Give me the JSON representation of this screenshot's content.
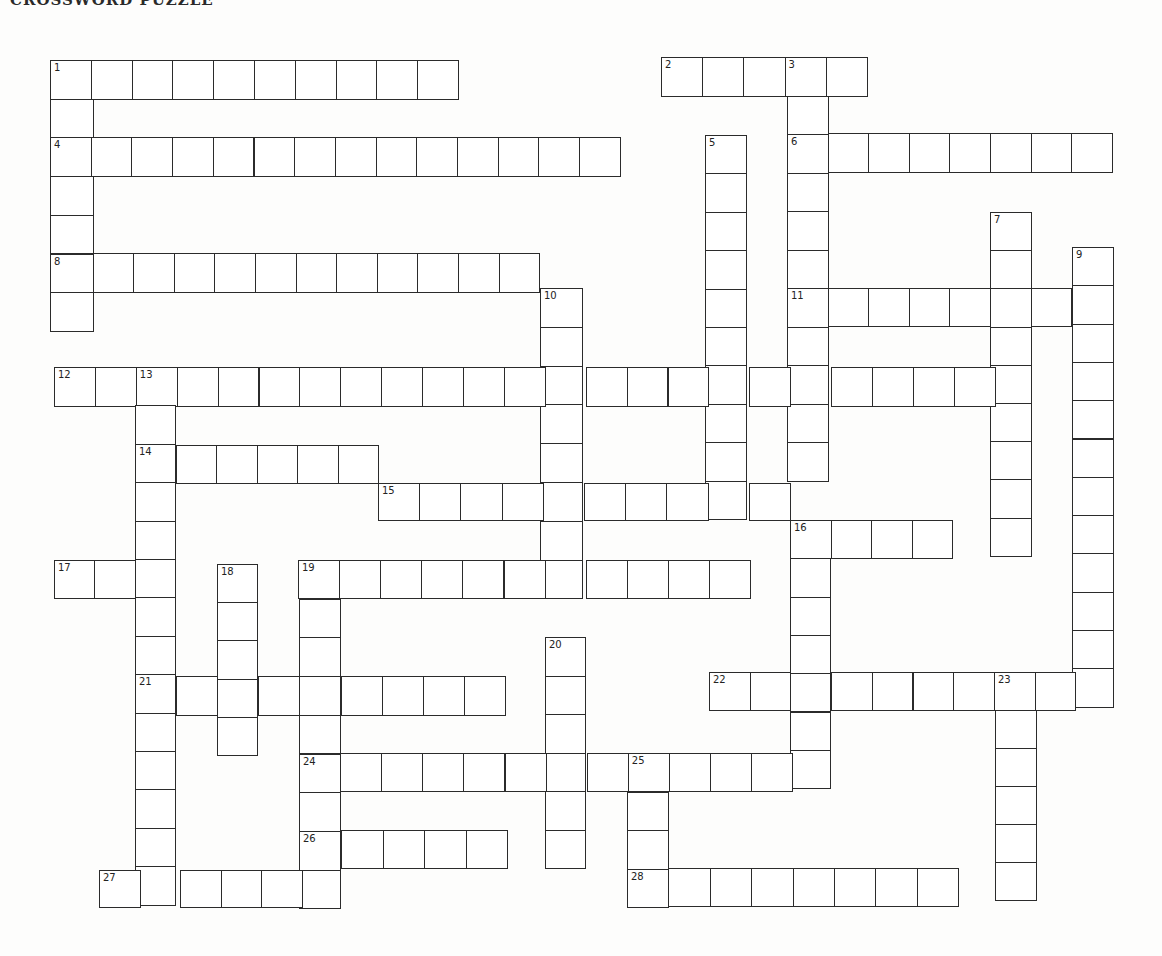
{
  "puzzle": {
    "title_partial": "CROSSWORD PUZZLE",
    "ink_color": "#2b2b2b",
    "paper_color": "#fdfdfc"
  },
  "entries": [
    {
      "number": "1",
      "direction": "across",
      "x": 50,
      "y": 60,
      "w": 40.8,
      "h": 39,
      "length": 10
    },
    {
      "number": "1",
      "direction": "down",
      "x": 50,
      "y": 60,
      "w": 43,
      "h": 38.7,
      "length": 7
    },
    {
      "number": "2",
      "direction": "across",
      "x": 661,
      "y": 57,
      "w": 41.2,
      "h": 39,
      "length": 5
    },
    {
      "number": "3",
      "direction": "down",
      "x": 787,
      "y": 57,
      "w": 41,
      "h": 38.5,
      "length": 11
    },
    {
      "number": "4",
      "direction": "across",
      "x": 50,
      "y": 137,
      "w": 40.7,
      "h": 39,
      "length": 14
    },
    {
      "number": "5",
      "direction": "down",
      "x": 705,
      "y": 135,
      "w": 41,
      "h": 38.4,
      "length": 10
    },
    {
      "number": "6",
      "direction": "across",
      "x": 787,
      "y": 133,
      "w": 40.6,
      "h": 39,
      "length": 8
    },
    {
      "number": "7",
      "direction": "down",
      "x": 990,
      "y": 212,
      "w": 41,
      "h": 38.2,
      "length": 9
    },
    {
      "number": "8",
      "direction": "across",
      "x": 52,
      "y": 253,
      "w": 40.6,
      "h": 39,
      "length": 12
    },
    {
      "number": "9",
      "direction": "down",
      "x": 1072,
      "y": 247,
      "w": 41,
      "h": 38.3,
      "length": 12
    },
    {
      "number": "10",
      "direction": "down",
      "x": 540,
      "y": 288,
      "w": 42,
      "h": 38.8,
      "length": 8
    },
    {
      "number": "11",
      "direction": "across",
      "x": 787,
      "y": 288,
      "w": 40.6,
      "h": 38,
      "length": 8
    },
    {
      "number": "12",
      "direction": "across",
      "x": 54,
      "y": 367,
      "w": 40.9,
      "h": 39,
      "length": 24
    },
    {
      "number": "13",
      "direction": "down",
      "x": 135,
      "y": 367,
      "w": 40,
      "h": 38.4,
      "length": 14
    },
    {
      "number": "14",
      "direction": "across",
      "x": 135,
      "y": 445,
      "w": 40.5,
      "h": 38,
      "length": 6
    },
    {
      "number": "15",
      "direction": "across",
      "x": 378,
      "y": 483,
      "w": 41.2,
      "h": 37,
      "length": 10
    },
    {
      "number": "16",
      "direction": "across",
      "x": 790,
      "y": 520,
      "w": 40.5,
      "h": 38,
      "length": 4
    },
    {
      "number": "16",
      "direction": "down",
      "x": 790,
      "y": 520,
      "w": 40,
      "h": 38.3,
      "length": 7
    },
    {
      "number": "17",
      "direction": "across",
      "x": 54,
      "y": 560,
      "w": 40.3,
      "h": 38,
      "length": 3
    },
    {
      "number": "18",
      "direction": "down",
      "x": 217,
      "y": 564,
      "w": 40,
      "h": 38.2,
      "length": 5
    },
    {
      "number": "19",
      "direction": "across",
      "x": 298,
      "y": 560,
      "w": 41.1,
      "h": 38,
      "length": 11
    },
    {
      "number": "19",
      "direction": "down",
      "x": 299,
      "y": 560,
      "w": 41,
      "h": 38.7,
      "length": 9
    },
    {
      "number": "20",
      "direction": "down",
      "x": 545,
      "y": 637,
      "w": 40,
      "h": 38.5,
      "length": 6
    },
    {
      "number": "21",
      "direction": "across",
      "x": 135,
      "y": 676,
      "w": 41.1,
      "h": 39,
      "length": 9
    },
    {
      "number": "22",
      "direction": "across",
      "x": 709,
      "y": 672,
      "w": 40.7,
      "h": 38,
      "length": 10
    },
    {
      "number": "23",
      "direction": "down",
      "x": 995,
      "y": 672,
      "w": 41,
      "h": 38,
      "length": 6
    },
    {
      "number": "24",
      "direction": "across",
      "x": 299,
      "y": 753,
      "w": 41.1,
      "h": 38,
      "length": 13
    },
    {
      "number": "25",
      "direction": "down",
      "x": 627,
      "y": 753,
      "w": 41,
      "h": 38.5,
      "length": 4
    },
    {
      "number": "26",
      "direction": "across",
      "x": 300,
      "y": 830,
      "w": 41.4,
      "h": 38,
      "length": 5
    },
    {
      "number": "27",
      "direction": "across",
      "x": 99,
      "y": 870,
      "w": 40.5,
      "h": 37,
      "length": 6
    },
    {
      "number": "28",
      "direction": "across",
      "x": 627,
      "y": 868,
      "w": 41.4,
      "h": 38,
      "length": 8
    }
  ],
  "numbered_cells": [
    {
      "number": "1",
      "x": 50,
      "y": 60
    },
    {
      "number": "2",
      "x": 661,
      "y": 57
    },
    {
      "number": "3",
      "x": 787,
      "y": 57
    },
    {
      "number": "4",
      "x": 50,
      "y": 137
    },
    {
      "number": "5",
      "x": 705,
      "y": 135
    },
    {
      "number": "6",
      "x": 787,
      "y": 133
    },
    {
      "number": "7",
      "x": 990,
      "y": 212
    },
    {
      "number": "8",
      "x": 52,
      "y": 253
    },
    {
      "number": "9",
      "x": 1072,
      "y": 247
    },
    {
      "number": "10",
      "x": 540,
      "y": 288
    },
    {
      "number": "11",
      "x": 787,
      "y": 288
    },
    {
      "number": "12",
      "x": 54,
      "y": 367
    },
    {
      "number": "13",
      "x": 135,
      "y": 367
    },
    {
      "number": "14",
      "x": 135,
      "y": 445
    },
    {
      "number": "15",
      "x": 378,
      "y": 483
    },
    {
      "number": "16",
      "x": 790,
      "y": 520
    },
    {
      "number": "17",
      "x": 54,
      "y": 560
    },
    {
      "number": "18",
      "x": 217,
      "y": 564
    },
    {
      "number": "19",
      "x": 298,
      "y": 560
    },
    {
      "number": "20",
      "x": 545,
      "y": 637
    },
    {
      "number": "21",
      "x": 135,
      "y": 676
    },
    {
      "number": "22",
      "x": 709,
      "y": 672
    },
    {
      "number": "23",
      "x": 995,
      "y": 672
    },
    {
      "number": "24",
      "x": 299,
      "y": 753
    },
    {
      "number": "25",
      "x": 627,
      "y": 753
    },
    {
      "number": "26",
      "x": 300,
      "y": 830
    },
    {
      "number": "27",
      "x": 99,
      "y": 870
    },
    {
      "number": "28",
      "x": 627,
      "y": 868
    }
  ]
}
